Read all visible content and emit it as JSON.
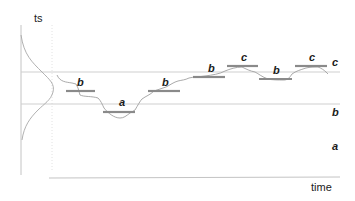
{
  "diagram": {
    "y_axis_label": "ts",
    "x_axis_label": "time",
    "level_labels": {
      "upper": "c",
      "middle": "b",
      "lower": "a"
    },
    "thresholds": {
      "upper_y": 72,
      "lower_y": 104
    },
    "segments": [
      {
        "label": "b",
        "x1": 66,
        "x2": 95,
        "y": 91
      },
      {
        "label": "a",
        "x1": 103,
        "x2": 135,
        "y": 112
      },
      {
        "label": "b",
        "x1": 148,
        "x2": 180,
        "y": 91
      },
      {
        "label": "b",
        "x1": 193,
        "x2": 225,
        "y": 77
      },
      {
        "label": "c",
        "x1": 227,
        "x2": 258,
        "y": 66
      },
      {
        "label": "b",
        "x1": 259,
        "x2": 292,
        "y": 79
      },
      {
        "label": "c",
        "x1": 295,
        "x2": 327,
        "y": 66
      }
    ],
    "colors": {
      "axis": "#bbbbbb",
      "threshold": "#cccccc",
      "segment": "#8a8a8a",
      "series": "#999999",
      "text": "#1a1a1a"
    }
  }
}
